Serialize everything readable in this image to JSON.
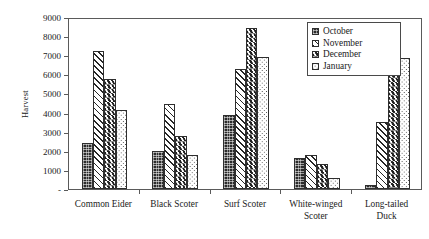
{
  "chart_data": {
    "type": "bar",
    "title": "",
    "xlabel": "",
    "ylabel": "Harvest",
    "ylim": [
      0,
      9000
    ],
    "ytick_values": [
      0,
      1000,
      2000,
      3000,
      4000,
      5000,
      6000,
      7000,
      8000,
      9000
    ],
    "ytick_labels": [
      "-",
      "1000",
      "2000",
      "3000",
      "4000",
      "5000",
      "6000",
      "7000",
      "8000",
      "9000"
    ],
    "grid": false,
    "legend_position": "top-right-inside",
    "categories": [
      "Common Eider",
      "Black Scoter",
      "Surf Scoter",
      "White-winged\nScoter",
      "Long-tailed\nDuck"
    ],
    "series": [
      {
        "name": "October",
        "pattern": "solid-dark-stipple",
        "values": [
          2400,
          1980,
          3880,
          1640,
          220
        ]
      },
      {
        "name": "November",
        "pattern": "diagonal-hatch",
        "values": [
          7200,
          4470,
          6260,
          1770,
          3500
        ]
      },
      {
        "name": "December",
        "pattern": "chevron-herringbone",
        "values": [
          5780,
          2800,
          8400,
          1300,
          7460
        ]
      },
      {
        "name": "January",
        "pattern": "dotted",
        "values": [
          4150,
          1770,
          6920,
          600,
          6860
        ]
      }
    ]
  },
  "legend": {
    "items": [
      {
        "label": "October"
      },
      {
        "label": "November"
      },
      {
        "label": "December"
      },
      {
        "label": "January"
      }
    ]
  },
  "axes": {
    "y_title": "Harvest"
  },
  "colors": {
    "axis": "#5a5a5a",
    "bar_outline": "#2e2e2e",
    "ink": "#1a1a1a",
    "background": "#ffffff"
  }
}
